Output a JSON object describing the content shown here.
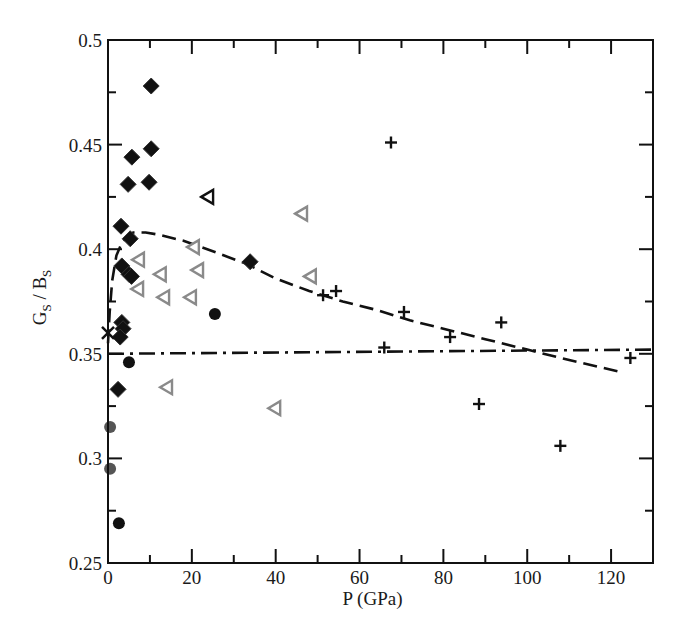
{
  "chart_data": {
    "type": "scatter",
    "title": "",
    "xlabel": "P (GPa)",
    "ylabel": {
      "main": "G",
      "sub1": "S",
      "sep": " / B",
      "sub2": "S"
    },
    "xlim": [
      0,
      130
    ],
    "ylim": [
      0.25,
      0.5
    ],
    "xticks": [
      0,
      20,
      40,
      60,
      80,
      100,
      120
    ],
    "xtick_labels": [
      "0",
      "20",
      "40",
      "60",
      "80",
      "100",
      "120"
    ],
    "xminor": [
      10,
      30,
      50,
      70,
      90,
      110
    ],
    "yticks": [
      0.25,
      0.3,
      0.35,
      0.4,
      0.45,
      0.5
    ],
    "ytick_labels": [
      "0.25",
      "0.3",
      "0.35",
      "0.4",
      "0.45",
      "0.5"
    ],
    "yminor": [
      0.275,
      0.325,
      0.375,
      0.425,
      0.475
    ],
    "grid": false,
    "legend": "none",
    "series": [
      {
        "name": "black-diamonds",
        "marker": "diamond",
        "color": "#111111",
        "points": [
          [
            10.3,
            0.478
          ],
          [
            10.3,
            0.448
          ],
          [
            5.7,
            0.444
          ],
          [
            4.8,
            0.431
          ],
          [
            9.8,
            0.432
          ],
          [
            3.1,
            0.411
          ],
          [
            5.3,
            0.405
          ],
          [
            3.3,
            0.392
          ],
          [
            5.0,
            0.388
          ],
          [
            5.6,
            0.387
          ],
          [
            3.3,
            0.365
          ],
          [
            3.6,
            0.362
          ],
          [
            2.9,
            0.358
          ],
          [
            2.4,
            0.333
          ],
          [
            33.9,
            0.394
          ]
        ]
      },
      {
        "name": "grey-triangles",
        "marker": "triangle-left-open",
        "color": "#8a8a8a",
        "points": [
          [
            7.4,
            0.395
          ],
          [
            12.6,
            0.388
          ],
          [
            21.5,
            0.39
          ],
          [
            20.5,
            0.401
          ],
          [
            7.2,
            0.381
          ],
          [
            13.4,
            0.377
          ],
          [
            19.8,
            0.377
          ],
          [
            46.3,
            0.417
          ],
          [
            48.4,
            0.387
          ],
          [
            14.1,
            0.334
          ],
          [
            39.9,
            0.324
          ]
        ]
      },
      {
        "name": "black-triangle",
        "marker": "triangle-left-open",
        "color": "#111111",
        "points": [
          [
            23.9,
            0.425
          ]
        ]
      },
      {
        "name": "black-circles",
        "marker": "circle",
        "color": "#111111",
        "points": [
          [
            25.5,
            0.369
          ],
          [
            5.0,
            0.346
          ],
          [
            2.6,
            0.269
          ]
        ]
      },
      {
        "name": "grey-circles",
        "marker": "circle",
        "color": "#555555",
        "points": [
          [
            0.5,
            0.315
          ],
          [
            0.5,
            0.295
          ]
        ]
      },
      {
        "name": "x-mark",
        "marker": "x",
        "color": "#111111",
        "points": [
          [
            0.0,
            0.36
          ]
        ]
      },
      {
        "name": "plus-marks",
        "marker": "plus",
        "color": "#111111",
        "points": [
          [
            67.5,
            0.451
          ],
          [
            51.3,
            0.378
          ],
          [
            54.4,
            0.38
          ],
          [
            70.6,
            0.37
          ],
          [
            65.9,
            0.353
          ],
          [
            81.6,
            0.358
          ],
          [
            93.8,
            0.365
          ],
          [
            88.5,
            0.326
          ],
          [
            107.9,
            0.306
          ],
          [
            124.6,
            0.348
          ]
        ]
      }
    ],
    "lines": [
      {
        "name": "dashed-fit",
        "style": "dashed",
        "color": "#111111",
        "points": [
          [
            0.0,
            0.355
          ],
          [
            0.4,
            0.37
          ],
          [
            1.0,
            0.385
          ],
          [
            2.0,
            0.397
          ],
          [
            3.5,
            0.404
          ],
          [
            6.0,
            0.408
          ],
          [
            9.0,
            0.408
          ],
          [
            12.0,
            0.407
          ],
          [
            18.0,
            0.404
          ],
          [
            25.0,
            0.399
          ],
          [
            33.0,
            0.393
          ],
          [
            40.0,
            0.386
          ],
          [
            48.0,
            0.38
          ],
          [
            56.0,
            0.375
          ],
          [
            64.0,
            0.371
          ],
          [
            72.0,
            0.366
          ],
          [
            80.0,
            0.362
          ],
          [
            90.0,
            0.357
          ],
          [
            100.0,
            0.352
          ],
          [
            110.0,
            0.347
          ],
          [
            123.0,
            0.341
          ]
        ]
      },
      {
        "name": "dashdot-line",
        "style": "dashdot",
        "color": "#111111",
        "points": [
          [
            0.0,
            0.35
          ],
          [
            130.0,
            0.352
          ]
        ]
      }
    ]
  }
}
